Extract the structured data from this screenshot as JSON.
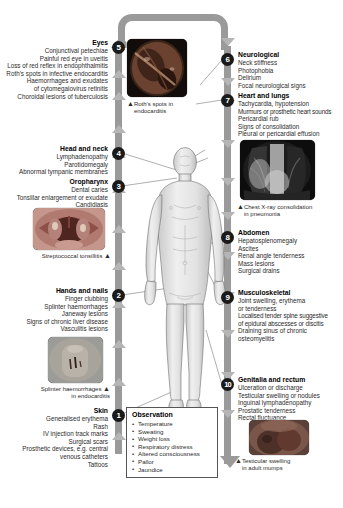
{
  "left_sections": [
    {
      "number": "5",
      "heading": "Eyes",
      "items": [
        "Conjunctival petechiae",
        "Painful red eye in uveitis",
        "Loss of red reflex in endophthalmitis",
        "Roth's spots in infective endocarditis",
        "Haemorrhages and exudates",
        "of cytomegalovirus retinitis",
        "Choroidal lesions of tuberculosis"
      ]
    },
    {
      "number": "4",
      "heading": "Head and neck",
      "items": [
        "Lymphadenopathy",
        "Parotidomegaly",
        "Abnormal tympanic membranes"
      ]
    },
    {
      "number": "3",
      "heading": "Oropharynx",
      "items": [
        "Dental caries",
        "Tonsillar enlargement or exudate",
        "Candidiasis"
      ]
    },
    {
      "number": "2",
      "heading": "Hands and nails",
      "items": [
        "Finger clubbing",
        "Splinter haemorrhages",
        "Janeway lesions",
        "Signs of chronic liver disease",
        "Vasculitis lesions"
      ]
    },
    {
      "number": "1",
      "heading": "Skin",
      "items": [
        "Generalised erythema",
        "Rash",
        "IV injection track marks",
        "Surgical scars",
        "Prosthetic devices, e.g. central",
        "venous catheters",
        "Tattoos"
      ]
    }
  ],
  "right_sections": [
    {
      "number": "6",
      "heading": "Neurological",
      "items": [
        "Neck stiffness",
        "Photophobia",
        "Delirium",
        "Focal neurological signs"
      ]
    },
    {
      "number": "7",
      "heading": "Heart and lungs",
      "items": [
        "Tachycardia, hypotension",
        "Murmurs or prosthetic heart sounds",
        "Pericardial rub",
        "Signs of consolidation",
        "Pleural or pericardial effusion"
      ]
    },
    {
      "number": "8",
      "heading": "Abdomen",
      "items": [
        "Hepatosplenomegaly",
        "Ascites",
        "Renal angle tenderness",
        "Mass lesions",
        "Surgical drains"
      ]
    },
    {
      "number": "9",
      "heading": "Musculoskeletal",
      "items": [
        "Joint swelling, erythema",
        "or tenderness",
        "Localised tender spine suggestive",
        "of epidural abscesses or discitis",
        "Draining sinus of chronic",
        "osteomyelitis"
      ]
    },
    {
      "number": "10",
      "heading": "Genitalia and rectum",
      "items": [
        "Ulceration or discharge",
        "Testicular swelling or nodules",
        "Inguinal lymphadenopathy",
        "Prostatic tenderness",
        "Rectal fluctuance"
      ]
    }
  ],
  "captions": {
    "eyes": "Roth's spots in\nendocarditis",
    "eyes_l1": "Roth's spots in",
    "eyes_l2": "endocarditis",
    "oropharynx": "Streptococcal tonsillitis",
    "hands_l1": "Splinter haemorrhages",
    "hands_l2": "in endocarditis",
    "chest_l1": "Chest X-ray consolidation",
    "chest_l2": "in pneumonia",
    "genital_l1": "Testicular swelling",
    "genital_l2": "in adult mumps"
  },
  "observation": {
    "heading": "Observation",
    "items": [
      "Temperature",
      "Sweating",
      "Weight loss",
      "Respiratory distress",
      "Altered consciousness",
      "Pallor",
      "Jaundice"
    ]
  },
  "colors": {
    "bar": "#9a9a9a",
    "chevron": "#b5b5b5",
    "badge": "#1a1a1a",
    "text": "#2b2b2b"
  }
}
